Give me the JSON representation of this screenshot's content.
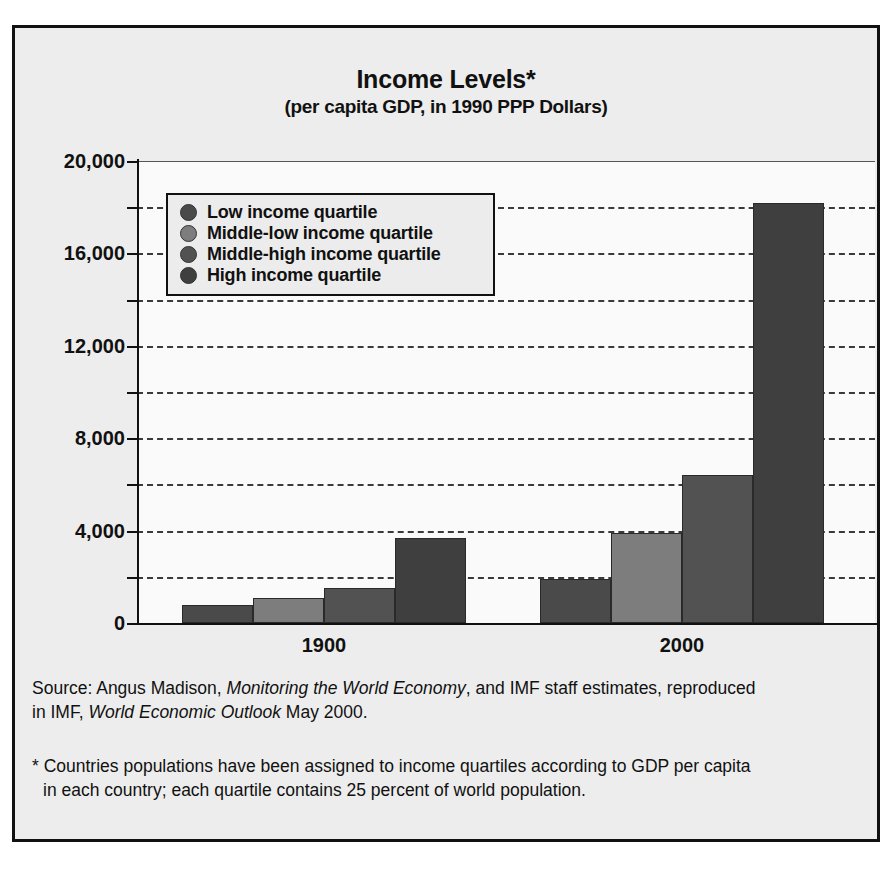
{
  "chart_data": {
    "type": "bar",
    "title": "Income Levels*",
    "subtitle": "(per capita GDP, in 1990 PPP Dollars)",
    "xlabel": "",
    "ylabel": "",
    "categories": [
      "1900",
      "2000"
    ],
    "ylim": [
      0,
      20000
    ],
    "ytick_labels": [
      "0",
      "4,000",
      "8,000",
      "12,000",
      "16,000",
      "20,000"
    ],
    "ytick_values": [
      0,
      4000,
      8000,
      12000,
      16000,
      20000
    ],
    "gridline_values": [
      2000,
      4000,
      6000,
      8000,
      10000,
      12000,
      14000,
      16000,
      18000,
      20000
    ],
    "grid": true,
    "legend_position": "upper left",
    "series": [
      {
        "name": "Low income quartile",
        "color": "#4a4a4a",
        "values": [
          800,
          1900
        ]
      },
      {
        "name": "Middle-low income quartile",
        "color": "#7d7d7d",
        "values": [
          1100,
          3900
        ]
      },
      {
        "name": "Middle-high income quartile",
        "color": "#525252",
        "values": [
          1500,
          6400
        ]
      },
      {
        "name": "High income quartile",
        "color": "#3f3f3f",
        "values": [
          3700,
          18200
        ]
      }
    ]
  },
  "notes": {
    "source_prefix": "Source: Angus Madison, ",
    "source_italic_1": "Monitoring the World Economy",
    "source_middle": ", and IMF staff estimates, reproduced",
    "source_line2_prefix": "in IMF, ",
    "source_italic_2": "World Economic Outlook",
    "source_line2_suffix": " May 2000.",
    "footnote_line1": "* Countries populations have been assigned to income quartiles according to GDP per capita",
    "footnote_line2": "in each country; each quartile contains 25 percent of world population."
  }
}
